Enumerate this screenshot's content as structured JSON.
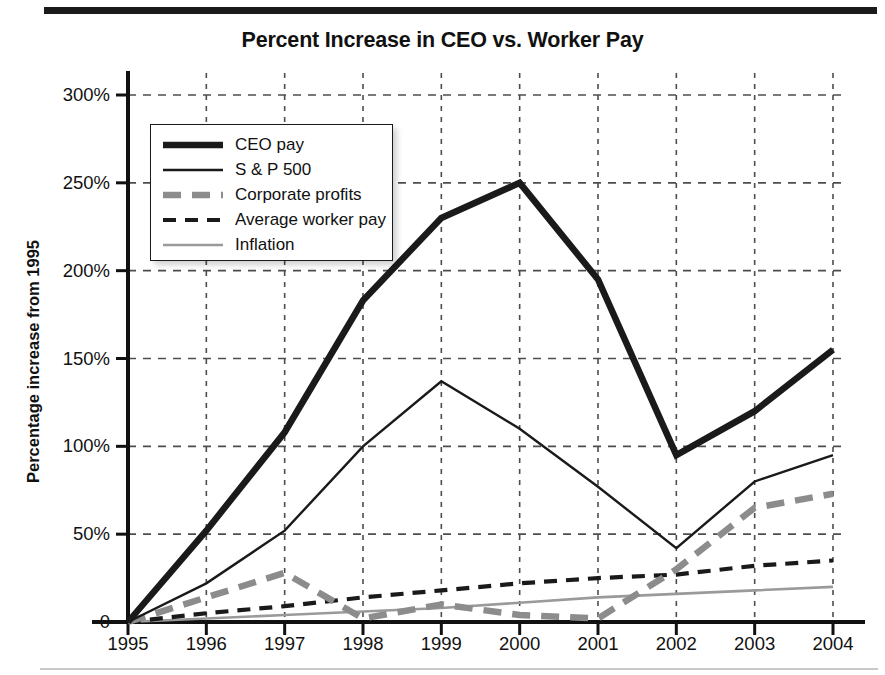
{
  "chart_data": {
    "type": "line",
    "title": "Percent Increase in CEO vs. Worker Pay",
    "xlabel": "",
    "ylabel": "Percentage increase from 1995",
    "x": [
      1995,
      1996,
      1997,
      1998,
      1999,
      2000,
      2001,
      2002,
      2003,
      2004
    ],
    "categories": [
      "1995",
      "1996",
      "1997",
      "1998",
      "1999",
      "2000",
      "2001",
      "2002",
      "2003",
      "2004"
    ],
    "xlim": [
      1995,
      2004
    ],
    "ylim": [
      0,
      300
    ],
    "ytick_values": [
      0,
      50,
      100,
      150,
      200,
      250,
      300
    ],
    "ytick_labels": [
      "0",
      "50%",
      "100%",
      "150%",
      "200%",
      "250%",
      "300%"
    ],
    "grid": true,
    "grid_style": "dashed",
    "legend_position": "upper-left-inside",
    "series": [
      {
        "name": "CEO pay",
        "values": [
          0,
          52,
          108,
          183,
          230,
          250,
          195,
          95,
          120,
          155
        ],
        "color": "#1a1a1a",
        "width": 6.5,
        "dash": "none"
      },
      {
        "name": "S & P 500",
        "values": [
          0,
          22,
          52,
          100,
          137,
          110,
          77,
          42,
          80,
          95
        ],
        "color": "#1a1a1a",
        "width": 2.4,
        "dash": "none"
      },
      {
        "name": "Corporate profits",
        "values": [
          0,
          14,
          28,
          2,
          10,
          4,
          2,
          30,
          65,
          73
        ],
        "color": "#8c8c8c",
        "width": 6.5,
        "dash": "18,11"
      },
      {
        "name": "Average worker pay",
        "values": [
          0,
          5,
          9,
          14,
          18,
          22,
          25,
          27,
          32,
          35
        ],
        "color": "#1a1a1a",
        "width": 4.2,
        "dash": "13,9"
      },
      {
        "name": "Inflation",
        "values": [
          0,
          2,
          4,
          6,
          8,
          11,
          14,
          16,
          18,
          20
        ],
        "color": "#9a9a9a",
        "width": 2.6,
        "dash": "none"
      }
    ]
  },
  "legend": {
    "items": [
      {
        "label": "CEO pay"
      },
      {
        "label": "S & P 500"
      },
      {
        "label": "Corporate profits"
      },
      {
        "label": "Average worker pay"
      },
      {
        "label": "Inflation"
      }
    ]
  }
}
